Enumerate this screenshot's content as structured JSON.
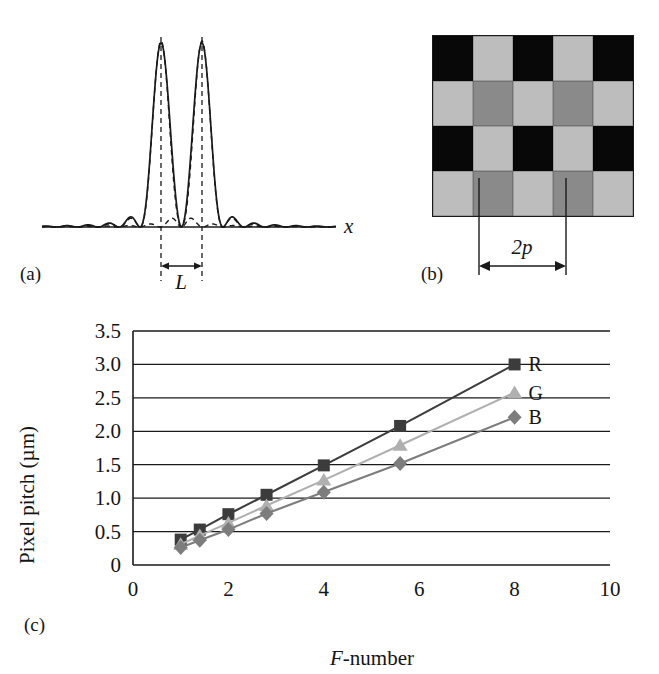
{
  "figure": {
    "panels": [
      {
        "id": "a",
        "label": "(a)"
      },
      {
        "id": "b",
        "label": "(b)"
      },
      {
        "id": "c",
        "label": "(c)"
      }
    ]
  },
  "panel_a": {
    "label": "(a)",
    "axis_label_x": "x",
    "separation_label": "L",
    "description": "Two overlapping Airy diffraction patterns (dashed) and their sum (solid), illustrating the Rayleigh resolution criterion",
    "peak_centers": [
      161,
      202
    ],
    "baseline_y": 227,
    "curve_color": "#1a1a1a"
  },
  "panel_b": {
    "label": "(b)",
    "pitch_label": "2p",
    "description": "Bayer-type colour filter mosaic, 5 columns by 4 rows",
    "colors": {
      "black": "#080808",
      "light": "#bdbdbd",
      "mid": "#8a8a8a"
    },
    "grid": [
      [
        "black",
        "light",
        "black",
        "light",
        "black"
      ],
      [
        "light",
        "mid",
        "light",
        "mid",
        "light"
      ],
      [
        "black",
        "light",
        "black",
        "light",
        "black"
      ],
      [
        "light",
        "mid",
        "light",
        "mid",
        "light"
      ]
    ]
  },
  "panel_c": {
    "label": "(c)"
  },
  "chart_data": {
    "type": "line",
    "title": "",
    "xlabel": "F-number",
    "xlabel_italic_prefix": "F",
    "xlabel_rest": "-number",
    "ylabel": "Pixel pitch (µm)",
    "xlim": [
      0,
      10
    ],
    "ylim": [
      0,
      3.5
    ],
    "xticks": [
      0,
      2,
      4,
      6,
      8,
      10
    ],
    "xticklabels": [
      "0",
      "2",
      "4",
      "6",
      "8",
      "10"
    ],
    "yticks": [
      0,
      0.5,
      1.0,
      1.5,
      2.0,
      2.5,
      3.0,
      3.5
    ],
    "yticklabels": [
      "0",
      "0.5",
      "1.0",
      "1.5",
      "2.0",
      "2.5",
      "3.0",
      "3.5"
    ],
    "grid": "horizontal",
    "legend_position": "right-inline",
    "x": [
      1,
      1.4,
      2,
      2.8,
      4,
      5.6,
      8
    ],
    "series": [
      {
        "name": "R",
        "label": "R",
        "marker": "square",
        "color": "#3c3c3c",
        "values": [
          0.38,
          0.53,
          0.76,
          1.05,
          1.49,
          2.08,
          3.0
        ]
      },
      {
        "name": "G",
        "label": "G",
        "marker": "triangle",
        "color": "#b0b0b0",
        "values": [
          0.31,
          0.44,
          0.63,
          0.89,
          1.27,
          1.79,
          2.58
        ]
      },
      {
        "name": "B",
        "label": "B",
        "marker": "diamond",
        "color": "#7d7d7d",
        "values": [
          0.26,
          0.37,
          0.53,
          0.77,
          1.09,
          1.52,
          2.21
        ]
      }
    ]
  }
}
